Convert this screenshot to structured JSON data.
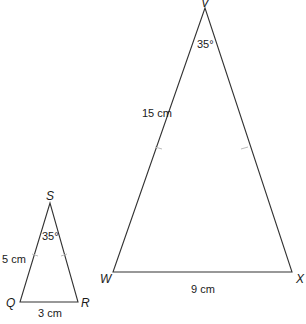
{
  "diagram": {
    "type": "similar-triangles",
    "small_triangle": {
      "vertices": {
        "apex": {
          "label": "S",
          "x": 50,
          "y": 203
        },
        "base_left": {
          "label": "Q",
          "x": 20,
          "y": 302
        },
        "base_right": {
          "label": "R",
          "x": 78,
          "y": 302
        }
      },
      "apex_angle": "35°",
      "side_label": "5 cm",
      "base_label": "3 cm",
      "equal_sides_marked": true
    },
    "large_triangle": {
      "vertices": {
        "apex": {
          "label": "V",
          "x": 205,
          "y": 8
        },
        "base_left": {
          "label": "W",
          "x": 113,
          "y": 272
        },
        "base_right": {
          "label": "X",
          "x": 292,
          "y": 272
        }
      },
      "apex_angle": "35°",
      "side_label": "15 cm",
      "base_label": "9 cm",
      "equal_sides_marked": true
    },
    "colors": {
      "line": "#333333",
      "text": "#1a1a1a",
      "tick": "#bbbbbb",
      "background": "#ffffff"
    }
  }
}
